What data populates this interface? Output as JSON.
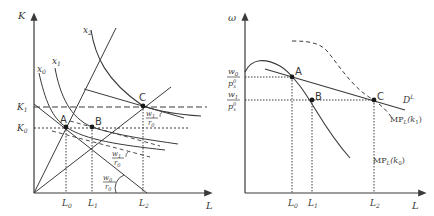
{
  "figure": {
    "left_panel": {
      "y_axis_label": "K",
      "x_axis_label": "L",
      "y_ticks": [
        {
          "main": "K",
          "sub": "1"
        },
        {
          "main": "K",
          "sub": "0"
        }
      ],
      "x_ticks": [
        {
          "main": "L",
          "sub": "0"
        },
        {
          "main": "L",
          "sub": "1"
        },
        {
          "main": "L",
          "sub": "2"
        }
      ],
      "isoquants": [
        {
          "main": "x",
          "sub": "0"
        },
        {
          "main": "x",
          "sub": "1"
        },
        {
          "main": "x",
          "sub": "2"
        }
      ],
      "points": [
        "A",
        "B",
        "C"
      ],
      "slope_labels": [
        {
          "num": "w",
          "num_sub": "1",
          "den": "r",
          "den_sub": "0"
        },
        {
          "num": "w",
          "num_sub": "1",
          "den": "r",
          "den_sub": "0"
        },
        {
          "num": "w",
          "num_sub": "0",
          "den": "r",
          "den_sub": "0"
        }
      ]
    },
    "right_panel": {
      "y_axis_label": "ω",
      "x_axis_label": "L",
      "y_ticks": [
        {
          "num": "w",
          "num_sub": "0",
          "den": "p",
          "den_sub": "x",
          "den_sup": "0"
        },
        {
          "num": "w",
          "num_sub": "1",
          "den": "p",
          "den_sub": "x",
          "den_sup": "0"
        }
      ],
      "x_ticks": [
        {
          "main": "L",
          "sub": "0"
        },
        {
          "main": "L",
          "sub": "1"
        },
        {
          "main": "L",
          "sub": "2"
        }
      ],
      "points": [
        "A",
        "B",
        "C"
      ],
      "curves": {
        "demand": {
          "main": "D",
          "sup": "L"
        },
        "mp_k1": {
          "main": "MP",
          "sub": "L",
          "arg": "(k",
          "arg_sub": "1",
          "close": ")"
        },
        "mp_k0": {
          "main": "MP",
          "sub": "L",
          "arg": "(k",
          "arg_sub": "0",
          "close": ")"
        }
      }
    },
    "colors": {
      "line": "#3a3a3a",
      "background": "#ffffff"
    }
  }
}
